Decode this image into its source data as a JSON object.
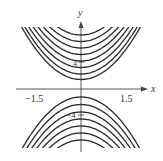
{
  "chart_data": {
    "type": "line",
    "title": "",
    "xlabel": "x",
    "ylabel": "y",
    "x_ticks": [
      "-1.5",
      "1.5"
    ],
    "y_ticks": [
      "4",
      "-4"
    ],
    "xlim": [
      -1.9,
      1.9
    ],
    "grid": false,
    "legend": null,
    "series": [
      {
        "name": "upper-family",
        "opening": "up",
        "count": 8,
        "vertex_pixel_y": [
          35,
          41.5,
          48,
          54.5,
          61,
          67.5,
          74,
          79.5
        ]
      },
      {
        "name": "lower-family",
        "opening": "down",
        "count": 7,
        "vertex_pixel_y": [
          97,
          104.5,
          112,
          119,
          126,
          133,
          140
        ]
      }
    ],
    "curvature_k": 0.0149,
    "line_color": "#2a2a2a"
  },
  "axes": {
    "x_label": "x",
    "y_label": "y",
    "x_tick_neg": "−1.5",
    "x_tick_pos": "1.5",
    "y_tick_pos": "4",
    "y_tick_neg": "−4"
  }
}
